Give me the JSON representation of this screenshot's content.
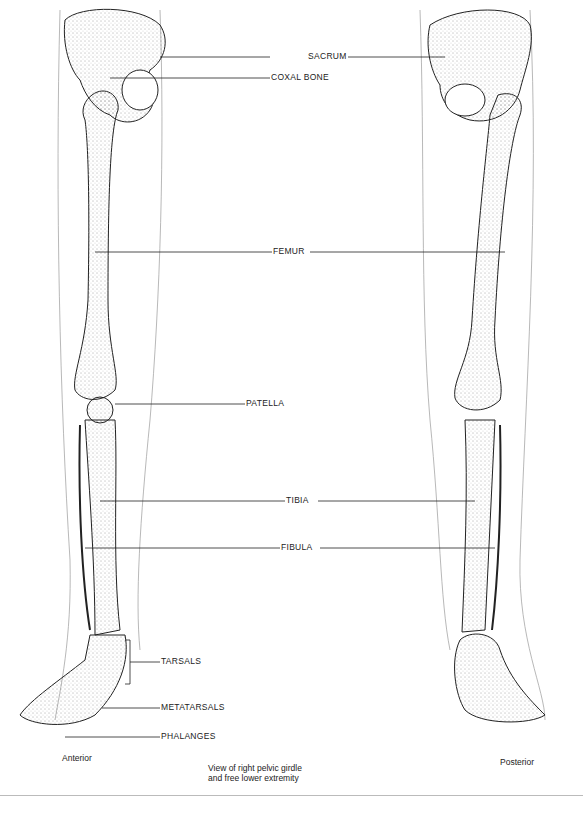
{
  "diagram": {
    "title": "View of right pelvic girdle and free lower extremity",
    "views": {
      "left": "Anterior",
      "right": "Posterior"
    },
    "caption": [
      "View of right pelvic girdle",
      "and free lower extremity"
    ],
    "labels": {
      "coxal_bone": "COXAL BONE",
      "sacrum": "SACRUM",
      "femur": "FEMUR",
      "patella": "PATELLA",
      "tibia": "TIBIA",
      "fibula": "FIBULA",
      "tarsals": "TARSALS",
      "metatarsals": "METATARSALS",
      "phalanges": "PHALANGES"
    }
  }
}
